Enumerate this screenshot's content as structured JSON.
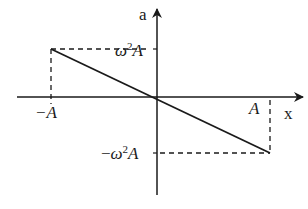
{
  "diagram": {
    "axes": {
      "y_label": "a",
      "x_label": "x"
    },
    "ticks": {
      "y_top": {
        "prefix": "",
        "omega": "ω",
        "exp": "2",
        "var": "A"
      },
      "y_bottom": {
        "prefix": "−",
        "omega": "ω",
        "exp": "2",
        "var": "A"
      },
      "x_left": "−A",
      "x_right": "A"
    },
    "line": {
      "description": "a = −ω²x",
      "start": {
        "x": "−A",
        "a": "ω²A"
      },
      "end": {
        "x": "A",
        "a": "−ω²A"
      }
    },
    "colors": {
      "stroke": "#1a1a1a",
      "background": "#ffffff"
    }
  }
}
